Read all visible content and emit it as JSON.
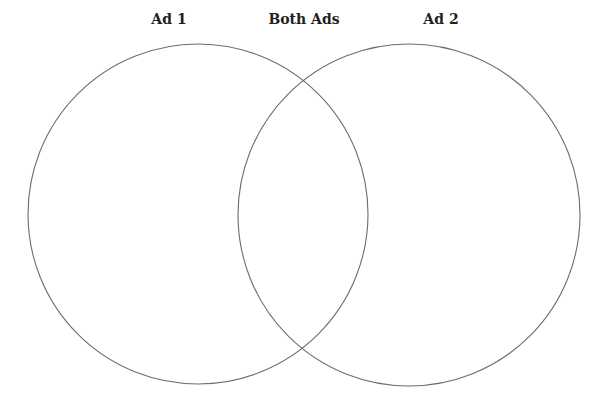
{
  "diagram": {
    "type": "venn",
    "labels": {
      "left": "Ad 1",
      "overlap": "Both Ads",
      "right": "Ad 2"
    },
    "sets": [
      {
        "name": "Ad 1",
        "cx": 198,
        "cy": 214,
        "r": 170
      },
      {
        "name": "Ad 2",
        "cx": 409,
        "cy": 215,
        "r": 171
      }
    ],
    "stroke_color": "#6d6d6d",
    "text_color": "#231f20",
    "background": "#ffffff"
  }
}
